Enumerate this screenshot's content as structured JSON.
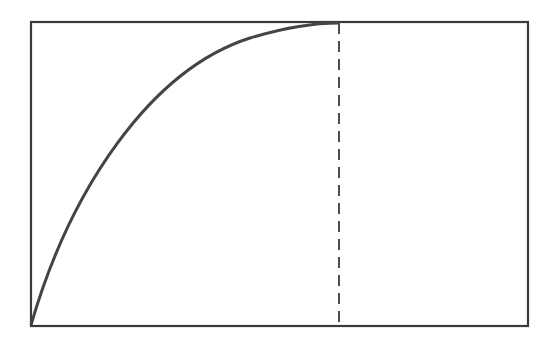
{
  "diagram": {
    "colors": {
      "background": "#ffffff",
      "stroke": "#3a3a3a",
      "curve": "#444444"
    },
    "rectangle": {
      "x1": 31,
      "y1": 22,
      "x2": 528,
      "y2": 326
    },
    "curve": {
      "points": [
        [
          31,
          325
        ],
        [
          45,
          280
        ],
        [
          70,
          215
        ],
        [
          100,
          163
        ],
        [
          135,
          118
        ],
        [
          170,
          88
        ],
        [
          205,
          61
        ],
        [
          250,
          39
        ],
        [
          300,
          27
        ],
        [
          339,
          23
        ]
      ]
    },
    "dashed_line": {
      "x": 339,
      "y_top": 23,
      "y_bottom": 326
    },
    "labels": []
  }
}
